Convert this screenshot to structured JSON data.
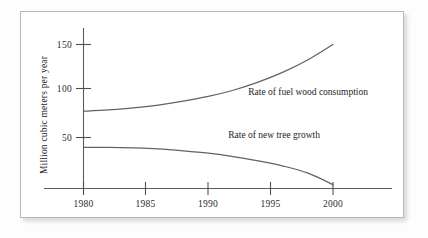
{
  "figure": {
    "background": "#ffffff",
    "frame_border_color": "#b9b9b9",
    "axis_color": "#555d63",
    "curve_color": "#5c646b",
    "text_color": "#1d1d1d"
  },
  "chart_data": {
    "type": "line",
    "title": "",
    "xlabel": "",
    "ylabel": "Million cubic meters per year",
    "xlim": [
      1979,
      2001
    ],
    "ylim": [
      0,
      160
    ],
    "xticks": [
      1980,
      1985,
      1990,
      1995,
      2000
    ],
    "xtick_labels": [
      "1980",
      "1985",
      "1990",
      "1995",
      "2000"
    ],
    "yticks": [
      50,
      100,
      150
    ],
    "ytick_labels": [
      "50",
      "100",
      "150"
    ],
    "grid": false,
    "legend": "inline-annotations",
    "series": [
      {
        "name": "Rate of fuel wood consumption",
        "label": "Rate of fuel wood consumption",
        "label_x": 1993.2,
        "label_y": 97,
        "x": [
          1980,
          1982,
          1984,
          1986,
          1988,
          1990,
          1992,
          1994,
          1996,
          1998,
          2000
        ],
        "values": [
          80,
          81.5,
          83.5,
          86.5,
          90.5,
          95.5,
          102,
          110.5,
          121,
          134,
          150
        ]
      },
      {
        "name": "Rate of new tree growth",
        "label": "Rate of new tree growth",
        "label_x": 1991.6,
        "label_y": 52,
        "x": [
          1980,
          1982,
          1984,
          1986,
          1988,
          1990,
          1992,
          1994,
          1996,
          1998,
          2000
        ],
        "values": [
          42,
          42,
          41.5,
          40.5,
          38.5,
          36,
          32.5,
          28,
          22.5,
          15,
          3
        ]
      }
    ]
  },
  "annotations": {
    "y_axis_title": "Million cubic meters per year",
    "series_one_label": "Rate of fuel wood consumption",
    "series_two_label": "Rate of new tree growth"
  }
}
